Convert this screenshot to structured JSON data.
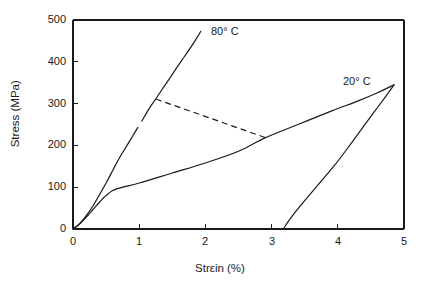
{
  "chart_data": {
    "type": "line",
    "title": "",
    "xlabel": "Strεin (%)",
    "ylabel": "Stress (MPa)",
    "xlim": [
      0,
      5
    ],
    "ylim": [
      0,
      500
    ],
    "xticks": [
      0,
      1,
      2,
      3,
      4,
      5
    ],
    "yticks": [
      0,
      100,
      200,
      300,
      400,
      500
    ],
    "xtick_labels": [
      "0",
      "1",
      "2",
      "3",
      "4",
      "5"
    ],
    "ytick_labels": [
      "0",
      "100",
      "200",
      "300",
      "400",
      "500"
    ],
    "grid": false,
    "legend": "inline-annotations",
    "line_color": "#1a1a1a",
    "series": [
      {
        "name": "80° C",
        "style": "solid",
        "label": "80° C",
        "label_x": 2.1,
        "label_y": 470,
        "note": "steep loading curve, small break near 1.0% strain",
        "points": [
          [
            0.0,
            0
          ],
          [
            0.08,
            10
          ],
          [
            0.15,
            22
          ],
          [
            0.22,
            36
          ],
          [
            0.3,
            55
          ],
          [
            0.4,
            82
          ],
          [
            0.5,
            110
          ],
          [
            0.6,
            140
          ],
          [
            0.7,
            170
          ],
          [
            0.8,
            196
          ],
          [
            0.9,
            222
          ],
          [
            0.98,
            243
          ]
        ],
        "points_after_break": [
          [
            1.04,
            258
          ],
          [
            1.15,
            288
          ],
          [
            1.25,
            311
          ],
          [
            1.35,
            335
          ],
          [
            1.45,
            358
          ],
          [
            1.55,
            382
          ],
          [
            1.65,
            405
          ],
          [
            1.75,
            428
          ],
          [
            1.85,
            452
          ],
          [
            1.93,
            473
          ]
        ]
      },
      {
        "name": "20° C",
        "style": "solid",
        "label": "20° C",
        "label_x": 4.35,
        "label_y": 330,
        "note": "loading curve with yield knee then unloading curve back to zero stress",
        "points": [
          [
            0.0,
            0
          ],
          [
            0.1,
            12
          ],
          [
            0.2,
            28
          ],
          [
            0.3,
            46
          ],
          [
            0.4,
            64
          ],
          [
            0.5,
            80
          ],
          [
            0.6,
            92
          ],
          [
            0.75,
            100
          ],
          [
            1.0,
            110
          ],
          [
            1.5,
            134
          ],
          [
            2.0,
            158
          ],
          [
            2.5,
            186
          ],
          [
            2.9,
            218
          ],
          [
            3.4,
            250
          ],
          [
            3.9,
            282
          ],
          [
            4.3,
            306
          ],
          [
            4.6,
            326
          ],
          [
            4.85,
            345
          ]
        ],
        "unloading_points": [
          [
            4.85,
            345
          ],
          [
            4.7,
            312
          ],
          [
            4.55,
            280
          ],
          [
            4.4,
            248
          ],
          [
            4.25,
            215
          ],
          [
            4.1,
            183
          ],
          [
            3.95,
            152
          ],
          [
            3.8,
            124
          ],
          [
            3.65,
            96
          ],
          [
            3.5,
            68
          ],
          [
            3.38,
            45
          ],
          [
            3.28,
            24
          ],
          [
            3.2,
            6
          ],
          [
            3.18,
            0
          ]
        ]
      },
      {
        "name": "transition",
        "style": "dashed",
        "label": "",
        "note": "dashed line connecting the 80° C curve to the 20° C curve",
        "points": [
          [
            1.25,
            311
          ],
          [
            2.9,
            219
          ]
        ]
      }
    ]
  },
  "axes": {
    "y_label_text": "Stress (MPa)",
    "x_label_text": "Strεin (%)"
  },
  "annotations": {
    "hot": "80° C",
    "cold": "20° C"
  }
}
